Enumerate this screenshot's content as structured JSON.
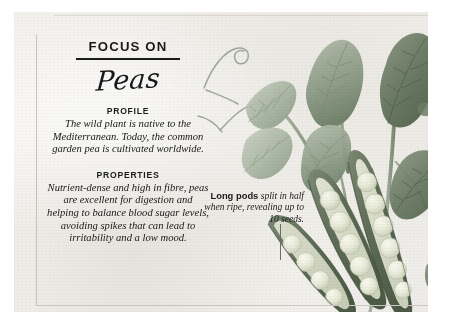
{
  "page": {
    "kicker": "FOCUS ON",
    "title_script": "Peas",
    "sections": [
      {
        "heading": "PROFILE",
        "body": "The wild plant is native to the Mediterranean. Today, the common garden pea is cultivated worldwide."
      },
      {
        "heading": "PROPERTIES",
        "body": "Nutrient-dense and high in fibre, peas are excellent for digestion and helping to balance blood sugar levels, avoiding spikes that can lead to irritability and a low mood."
      }
    ],
    "caption": {
      "lead": "Long pods",
      "rest": " split in half when ripe, revealing up to 10 seeds."
    }
  },
  "colors": {
    "paper": "#f2f0ec",
    "ink": "#1a1a18",
    "rule": "#c9c6bf",
    "leaf_light": "#c2cbbd",
    "leaf_mid": "#9caa96",
    "leaf_dark": "#6f7f6c",
    "pod_dark": "#5d6b57",
    "pea_fill": "#e8ead9",
    "flower": "#f4f2ee"
  }
}
